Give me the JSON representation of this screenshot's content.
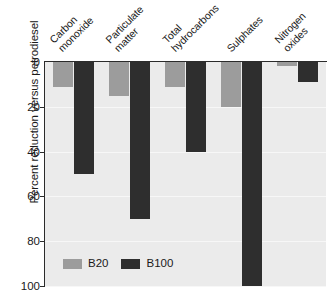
{
  "chart_data": {
    "type": "bar",
    "title": "",
    "subtitle": "",
    "xlabel": "",
    "ylabel": "Percent reduction versus petrodiesel",
    "ylim": [
      0,
      100
    ],
    "y_axis_inverted": true,
    "yticks": [
      0,
      20,
      40,
      60,
      80,
      100
    ],
    "ytick_labels": [
      "0",
      "20",
      "40",
      "60",
      "80",
      "100"
    ],
    "grid": true,
    "legend_position": "bottom-left",
    "categories": [
      "Carbon\nmonoxide",
      "Particulate\nmatter",
      "Total\nhydrocarbons",
      "Sulphates",
      "Nitrogen\noxides"
    ],
    "series": [
      {
        "name": "B20",
        "color": "#9c9c9c",
        "values": [
          11,
          15,
          11,
          20,
          2
        ]
      },
      {
        "name": "B100",
        "color": "#2e2e2e",
        "values": [
          50,
          70,
          40,
          100,
          9
        ]
      }
    ],
    "annotations": []
  },
  "legend": {
    "entries": [
      {
        "label": "B20",
        "swatch": "b20"
      },
      {
        "label": "B100",
        "swatch": "b100"
      }
    ]
  },
  "colors": {
    "b20": "#9c9c9c",
    "b100": "#2e2e2e",
    "plot_background": "#ebebeb",
    "axis": "#2b2b2b",
    "gridline": "#f7f7f7",
    "page_background": "#ffffff"
  }
}
